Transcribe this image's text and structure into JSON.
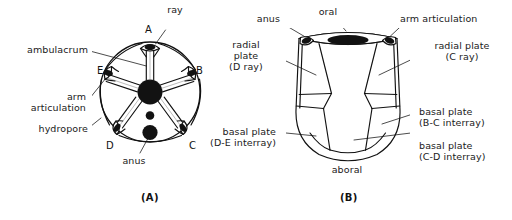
{
  "figure": {
    "panels": [
      {
        "id": "A",
        "caption": "(A)",
        "view": "oral (aboral) disc view"
      },
      {
        "id": "B",
        "caption": "(B)",
        "view": "lateral calyx view"
      }
    ]
  },
  "panel_a": {
    "caption": "(A)",
    "ray_letters": [
      {
        "id": "A",
        "label": "A"
      },
      {
        "id": "B",
        "label": "B"
      },
      {
        "id": "C",
        "label": "C"
      },
      {
        "id": "D",
        "label": "D"
      },
      {
        "id": "E",
        "label": "E"
      }
    ],
    "labels": [
      {
        "name": "ray",
        "text": "ray"
      },
      {
        "name": "ambulacrum",
        "text": "ambulacrum"
      },
      {
        "name": "arm-articulation",
        "text_line1": "arm",
        "text_line2": "articulation"
      },
      {
        "name": "hydropore",
        "text": "hydropore"
      },
      {
        "name": "anus",
        "text": "anus"
      }
    ]
  },
  "panel_b": {
    "caption": "(B)",
    "labels": [
      {
        "name": "anus",
        "text": "anus"
      },
      {
        "name": "oral",
        "text": "oral"
      },
      {
        "name": "arm-articulation",
        "text": "arm articulation"
      },
      {
        "name": "radial-plate-d-ray",
        "line1": "radial",
        "line2": "plate",
        "line3": "(D ray)"
      },
      {
        "name": "radial-plate-c-ray",
        "line1": "radial plate",
        "line2": "(C ray)"
      },
      {
        "name": "basal-plate-bc",
        "line1": "basal plate",
        "line2": "(B-C interray)"
      },
      {
        "name": "basal-plate-cd",
        "line1": "basal plate",
        "line2": "(C-D interray)"
      },
      {
        "name": "basal-plate-de",
        "line1": "basal plate",
        "line2": "(D-E interray)"
      },
      {
        "name": "aboral",
        "text": "aboral"
      }
    ]
  },
  "style": {
    "ink": "#111111",
    "paper": "#ffffff",
    "fill_dark": "#121212"
  }
}
